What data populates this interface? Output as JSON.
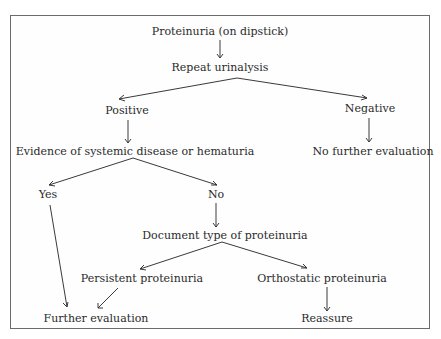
{
  "diagram": {
    "type": "flowchart",
    "nodes": {
      "n1": "Proteinuria (on dipstick)",
      "n2": "Repeat urinalysis",
      "n3": "Positive",
      "n4": "Negative",
      "n5": "Evidence of systemic disease or hematuria",
      "n6": "No further evaluation",
      "n7": "Yes",
      "n8": "No",
      "n9": "Document type of proteinuria",
      "n10": "Persistent proteinuria",
      "n11": "Orthostatic proteinuria",
      "n12": "Further evaluation",
      "n13": "Reassure"
    },
    "edges": [
      [
        "Proteinuria (on dipstick)",
        "Repeat urinalysis"
      ],
      [
        "Repeat urinalysis",
        "Positive"
      ],
      [
        "Repeat urinalysis",
        "Negative"
      ],
      [
        "Positive",
        "Evidence of systemic disease or hematuria"
      ],
      [
        "Negative",
        "No further evaluation"
      ],
      [
        "Evidence of systemic disease or hematuria",
        "Yes"
      ],
      [
        "Evidence of systemic disease or hematuria",
        "No"
      ],
      [
        "No",
        "Document type of proteinuria"
      ],
      [
        "Document type of proteinuria",
        "Persistent proteinuria"
      ],
      [
        "Document type of proteinuria",
        "Orthostatic proteinuria"
      ],
      [
        "Yes",
        "Further evaluation"
      ],
      [
        "Persistent proteinuria",
        "Further evaluation"
      ],
      [
        "Orthostatic proteinuria",
        "Reassure"
      ]
    ],
    "colors": {
      "line": "#3a3a3a",
      "text": "#2a2a2a",
      "frame": "#6b6b6b",
      "background": "#ffffff"
    }
  }
}
